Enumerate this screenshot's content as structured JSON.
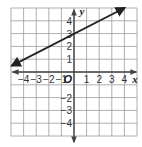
{
  "chart_data": {
    "type": "line",
    "title": "",
    "xlabel": "x",
    "ylabel": "y",
    "origin_label": "O",
    "xlim": [
      -5,
      5
    ],
    "ylim": [
      -5,
      5
    ],
    "grid": true,
    "x_ticks": [
      -4,
      -3,
      -2,
      -1,
      1,
      2,
      3,
      4
    ],
    "y_ticks": [
      4,
      3,
      2,
      1,
      -2,
      -3,
      -4
    ],
    "x_tick_labels": [
      "−4",
      "−3",
      "−2",
      "−1",
      "1",
      "2",
      "3",
      "4"
    ],
    "y_tick_labels": [
      "4",
      "3",
      "2",
      "1",
      "−2",
      "−3",
      "−4"
    ],
    "series": [
      {
        "name": "line",
        "equation": "y = 0.5x + 3",
        "slope": 0.5,
        "intercept": 3,
        "x": [
          -5,
          4
        ],
        "y": [
          0.5,
          5
        ],
        "arrows": "both",
        "color": "#222222"
      }
    ],
    "legend": null
  },
  "colors": {
    "grid": "#9a9a9a",
    "axis": "#444444",
    "line": "#222222"
  }
}
